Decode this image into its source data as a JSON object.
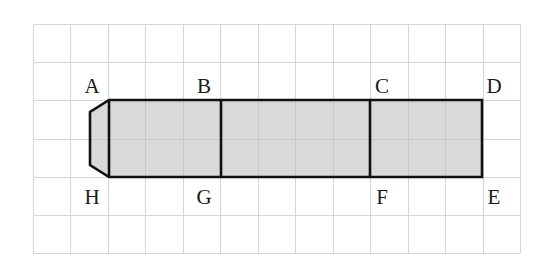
{
  "diagram": {
    "type": "grid-figure",
    "grid": {
      "columns": 13,
      "rows": 6,
      "origin_px": [
        33,
        24
      ],
      "cell_w": 37.46,
      "cell_h": 38.2,
      "line_color": "#d6d6d6"
    },
    "shape": {
      "fill_color": "#d9d9d9",
      "stroke_color": "#111111",
      "description": "Gray rectangular strip ABGH-BCFG-CDEF with a beveled cap on the left side",
      "outer_rect": {
        "x1": 109,
        "y1": 100,
        "x2": 482,
        "y2": 177
      },
      "left_cap": [
        [
          109,
          100
        ],
        [
          90,
          112
        ],
        [
          90,
          165
        ],
        [
          109,
          177
        ]
      ],
      "dividers_x": [
        221,
        370
      ]
    },
    "labels": [
      {
        "text": "A",
        "x": 92,
        "y": 86
      },
      {
        "text": "B",
        "x": 204,
        "y": 86
      },
      {
        "text": "C",
        "x": 382,
        "y": 86
      },
      {
        "text": "D",
        "x": 494,
        "y": 86
      },
      {
        "text": "H",
        "x": 92,
        "y": 197
      },
      {
        "text": "G",
        "x": 204,
        "y": 197
      },
      {
        "text": "F",
        "x": 382,
        "y": 197
      },
      {
        "text": "E",
        "x": 494,
        "y": 197
      }
    ]
  }
}
